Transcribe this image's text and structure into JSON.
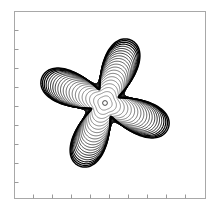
{
  "figure": {
    "background_color": "#ffffff",
    "width": 215,
    "height": 211
  },
  "axes": {
    "frame": {
      "x": 14,
      "y": 11,
      "width": 191,
      "height": 187,
      "border_color": "#a8a8a8",
      "border_width": 1,
      "fill_color": "#ffffff"
    },
    "ticks": {
      "color": "#9a9a9a",
      "length": 4,
      "width": 1,
      "direction": "in",
      "labels_visible": false,
      "x_positions": [
        33,
        52,
        71,
        90,
        109,
        128,
        147,
        166,
        185
      ],
      "y_positions": [
        30,
        49,
        68,
        87,
        106,
        125,
        144,
        163,
        182
      ]
    },
    "title": "",
    "xlabel": "",
    "ylabel": ""
  },
  "chart_data": {
    "type": "line",
    "title": "",
    "subtitle": "",
    "xlabel": "",
    "ylabel": "",
    "legend": [],
    "legend_position": "none",
    "grid": false,
    "plot_kind": "contour",
    "center_px": {
      "x": 105,
      "y": 103
    },
    "center_marker": {
      "shape": "circle",
      "radius_px": 2.4,
      "color": "#000000",
      "filled": false
    },
    "rotation_deg": 22,
    "extent_px": {
      "x_min": 66,
      "x_max": 148,
      "y_min": 63,
      "y_max": 148
    },
    "axis_ranges": {
      "xlim": [
        -1,
        1
      ],
      "ylim": [
        -1,
        1
      ]
    },
    "n_levels": 22,
    "lobes": 4,
    "levels": [
      {
        "index": 0,
        "radius_px": 2.4,
        "star_amp": 0.02,
        "line_width": 0.55,
        "color": "#3a3a3a"
      },
      {
        "index": 1,
        "radius_px": 7.0,
        "star_amp": 0.05,
        "line_width": 0.55,
        "color": "#383838"
      },
      {
        "index": 2,
        "radius_px": 11.0,
        "star_amp": 0.08,
        "line_width": 0.55,
        "color": "#363636"
      },
      {
        "index": 3,
        "radius_px": 14.6,
        "star_amp": 0.11,
        "line_width": 0.55,
        "color": "#343434"
      },
      {
        "index": 4,
        "radius_px": 17.8,
        "star_amp": 0.14,
        "line_width": 0.6,
        "color": "#323232"
      },
      {
        "index": 5,
        "radius_px": 20.7,
        "star_amp": 0.17,
        "line_width": 0.6,
        "color": "#303030"
      },
      {
        "index": 6,
        "radius_px": 23.3,
        "star_amp": 0.2,
        "line_width": 0.6,
        "color": "#2e2e2e"
      },
      {
        "index": 7,
        "radius_px": 25.7,
        "star_amp": 0.23,
        "line_width": 0.65,
        "color": "#2b2b2b"
      },
      {
        "index": 8,
        "radius_px": 27.9,
        "star_amp": 0.26,
        "line_width": 0.65,
        "color": "#282828"
      },
      {
        "index": 9,
        "radius_px": 29.9,
        "star_amp": 0.29,
        "line_width": 0.7,
        "color": "#252525"
      },
      {
        "index": 10,
        "radius_px": 31.7,
        "star_amp": 0.32,
        "line_width": 0.7,
        "color": "#222222"
      },
      {
        "index": 11,
        "radius_px": 33.4,
        "star_amp": 0.35,
        "line_width": 0.75,
        "color": "#1f1f1f"
      },
      {
        "index": 12,
        "radius_px": 34.9,
        "star_amp": 0.38,
        "line_width": 0.75,
        "color": "#1c1c1c"
      },
      {
        "index": 13,
        "radius_px": 36.3,
        "star_amp": 0.41,
        "line_width": 0.8,
        "color": "#191919"
      },
      {
        "index": 14,
        "radius_px": 37.6,
        "star_amp": 0.44,
        "line_width": 0.85,
        "color": "#161616"
      },
      {
        "index": 15,
        "radius_px": 38.7,
        "star_amp": 0.47,
        "line_width": 0.9,
        "color": "#131313"
      },
      {
        "index": 16,
        "radius_px": 39.7,
        "star_amp": 0.5,
        "line_width": 0.95,
        "color": "#101010"
      },
      {
        "index": 17,
        "radius_px": 40.6,
        "star_amp": 0.53,
        "line_width": 1.0,
        "color": "#0c0c0c"
      },
      {
        "index": 18,
        "radius_px": 41.4,
        "star_amp": 0.56,
        "line_width": 1.1,
        "color": "#080808"
      },
      {
        "index": 19,
        "radius_px": 42.0,
        "star_amp": 0.59,
        "line_width": 1.2,
        "color": "#050505"
      },
      {
        "index": 20,
        "radius_px": 42.5,
        "star_amp": 0.62,
        "line_width": 1.35,
        "color": "#020202"
      },
      {
        "index": 21,
        "radius_px": 42.9,
        "star_amp": 0.65,
        "line_width": 1.5,
        "color": "#000000"
      }
    ]
  }
}
